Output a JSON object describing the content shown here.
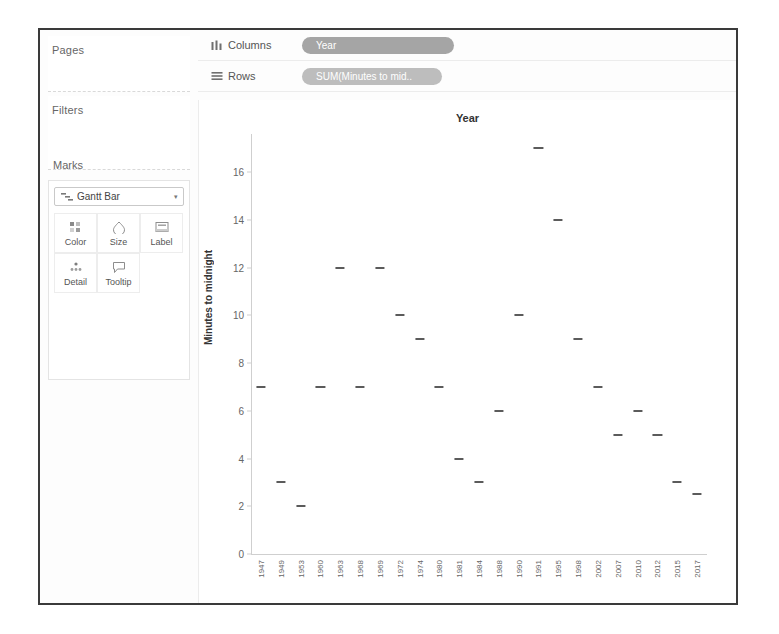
{
  "sidebar": {
    "pages_label": "Pages",
    "filters_label": "Filters",
    "marks_label": "Marks",
    "mark_type": "Gantt Bar",
    "mark_type_icon": "gantt-bar-icon",
    "caret": "▾",
    "buttons": [
      {
        "label": "Color",
        "icon": "color-icon"
      },
      {
        "label": "Size",
        "icon": "size-icon"
      },
      {
        "label": "Label",
        "icon": "label-icon"
      },
      {
        "label": "Detail",
        "icon": "detail-icon"
      },
      {
        "label": "Tooltip",
        "icon": "tooltip-icon"
      }
    ]
  },
  "shelves": {
    "columns_label": "Columns",
    "columns_icon": "columns-icon",
    "columns_pill": "Year",
    "rows_label": "Rows",
    "rows_icon": "rows-icon",
    "rows_pill": "SUM(Minutes to mid..",
    "pill_dimension_color": "#a5a5a5",
    "pill_measure_color": "#bdbdbd"
  },
  "chart_data": {
    "type": "scatter",
    "title": "Year",
    "xlabel": "",
    "ylabel": "Minutes to midnight",
    "ylim": [
      0,
      17.6
    ],
    "yticks": [
      0,
      2,
      4,
      6,
      8,
      10,
      12,
      14,
      16
    ],
    "grid": false,
    "legend": null,
    "mark_color": "#5b5b5b",
    "categories": [
      "1947",
      "1949",
      "1953",
      "1960",
      "1963",
      "1968",
      "1969",
      "1972",
      "1974",
      "1980",
      "1981",
      "1984",
      "1988",
      "1990",
      "1991",
      "1995",
      "1998",
      "2002",
      "2007",
      "2010",
      "2012",
      "2015",
      "2017"
    ],
    "values": [
      7,
      3,
      2,
      7,
      12,
      7,
      12,
      10,
      9,
      7,
      4,
      3,
      6,
      10,
      17,
      14,
      9,
      7,
      5,
      6,
      5,
      3,
      2.5
    ]
  }
}
